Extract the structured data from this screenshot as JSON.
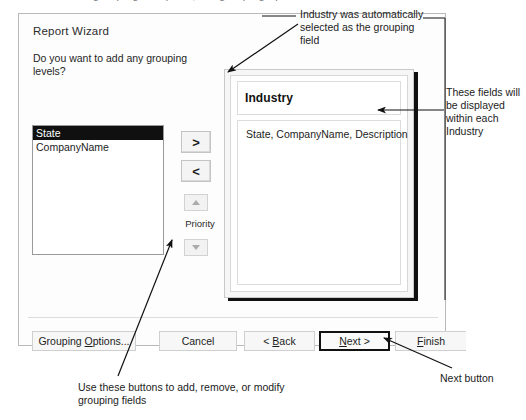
{
  "top_cut_text": "about grouping in reports, the grouping options",
  "dialog": {
    "title": "Report Wizard",
    "prompt": "Do you want to add any grouping levels?",
    "field_list": {
      "items": [
        {
          "label": "State",
          "selected": true
        },
        {
          "label": "CompanyName",
          "selected": false
        }
      ]
    },
    "buttons": {
      "add": ">",
      "remove": "<",
      "priority_label": "Priority",
      "move_up": "up-arrow",
      "move_down": "down-arrow"
    },
    "preview": {
      "group_field": "Industry",
      "detail_fields": "State, CompanyName, Description"
    },
    "footer": {
      "grouping_options": "Grouping Options...",
      "grouping_options_accel": "O",
      "cancel": "Cancel",
      "back": "< Back",
      "back_accel": "B",
      "next": "Next >",
      "next_accel": "N",
      "finish": "Finish",
      "finish_accel": "F",
      "default_button": "Next >"
    }
  },
  "annotations": {
    "top": "Industry was automatically selected as the grouping field",
    "right": "These fields will be displayed within each Industry",
    "next_button": "Next button",
    "bottom": "Use these buttons to add, remove, or modify grouping fields"
  },
  "colors": {
    "dialog_border": "#b9b9b9",
    "selection": "#101010",
    "default_button_border": "#111111",
    "annotation_text": "#1c1c1c"
  }
}
